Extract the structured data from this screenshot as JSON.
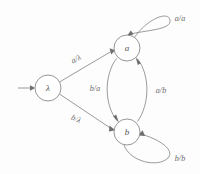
{
  "diagram": {
    "type": "finite-state-transducer",
    "background_color": "#fdfdfd",
    "line_color": "#8e8e8e",
    "label_color": "#6a6a6a",
    "states": [
      {
        "id": "lambda",
        "label": "λ",
        "cx": 48,
        "cy": 88,
        "r": 13,
        "initial": true
      },
      {
        "id": "a",
        "label": "a",
        "cx": 127,
        "cy": 48,
        "r": 13,
        "initial": false
      },
      {
        "id": "b",
        "label": "b",
        "cx": 127,
        "cy": 132,
        "r": 13,
        "initial": false
      }
    ],
    "start_arrow": {
      "label": "",
      "from_x": 18,
      "to_x": 34,
      "y": 88
    },
    "transitions": [
      {
        "id": "lambda-to-a",
        "from": "lambda",
        "to": "a",
        "label": "a/λ",
        "label_x": 76,
        "label_y": 59,
        "label_rotate": -27
      },
      {
        "id": "lambda-to-b",
        "from": "lambda",
        "to": "b",
        "label": "b/λ",
        "label_x": 76,
        "label_y": 119,
        "label_rotate": 27
      },
      {
        "id": "a-to-b",
        "from": "a",
        "to": "b",
        "label": "b/a",
        "label_x": 95,
        "label_y": 88,
        "label_rotate": 0
      },
      {
        "id": "b-to-a",
        "from": "b",
        "to": "a",
        "label": "a/b",
        "label_x": 161,
        "label_y": 90,
        "label_rotate": 0
      },
      {
        "id": "a-self-loop",
        "from": "a",
        "to": "a",
        "label": "a/a",
        "label_x": 180,
        "label_y": 18,
        "label_rotate": 0
      },
      {
        "id": "b-self-loop",
        "from": "b",
        "to": "b",
        "label": "b/b",
        "label_x": 180,
        "label_y": 158,
        "label_rotate": 0
      }
    ]
  }
}
